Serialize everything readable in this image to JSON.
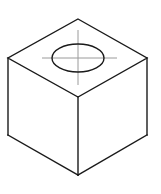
{
  "figure": {
    "type": "technical-line-drawing",
    "projection": "isometric",
    "canvas": {
      "width": 161,
      "height": 194
    },
    "background_color": "#ffffff",
    "line_color": "#1a1a1a",
    "centerline_color": "#9a9a9a",
    "face_color": "#ffffff",
    "edge_stroke_width": 1.4,
    "hole_stroke_width": 1.4,
    "centerline_stroke_width": 1.0
  },
  "geometry": {
    "vertices": {
      "top": {
        "x": 78,
        "y": 19
      },
      "left": {
        "x": 8,
        "y": 58
      },
      "right": {
        "x": 147,
        "y": 58
      },
      "front_top": {
        "x": 78,
        "y": 97
      },
      "left_bottom": {
        "x": 8,
        "y": 135
      },
      "right_bottom": {
        "x": 147,
        "y": 135
      },
      "bottom": {
        "x": 78,
        "y": 175
      }
    },
    "faces": {
      "top_face": "78,19 147,58 78,97 8,58",
      "left_face": "8,58 78,97 78,175 8,135",
      "right_face": "78,97 147,58 147,135 78,175"
    },
    "hole": {
      "label": "top-face circular hole (isometric ellipse)",
      "center_x": 78,
      "center_y": 58,
      "radius_x": 26,
      "radius_y": 14
    },
    "centerlines": {
      "horizontal": {
        "x1": 42,
        "y1": 58,
        "x2": 117,
        "y2": 58
      },
      "vertical": {
        "x1": 78,
        "y1": 30,
        "x2": 78,
        "y2": 85
      }
    }
  }
}
